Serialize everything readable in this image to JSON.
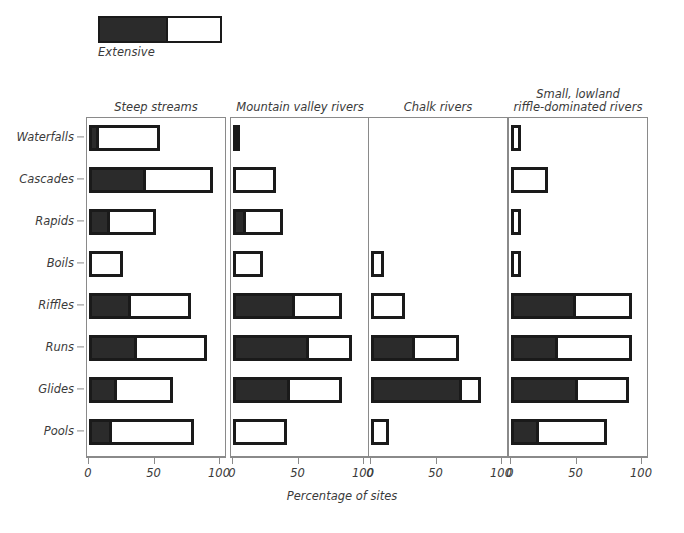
{
  "legend": {
    "label": "Extensive",
    "filled_color": "#2b2b2b",
    "open_color": "#ffffff",
    "border_color": "#1a1a1a"
  },
  "axis": {
    "x_title": "Percentage of sites",
    "tick_labels": [
      "0",
      "50",
      "100"
    ],
    "tick_values": [
      0,
      50,
      100
    ]
  },
  "chart_data": {
    "type": "bar",
    "orientation": "horizontal",
    "title": "",
    "subtitle": "",
    "xlabel": "Percentage of sites",
    "ylabel": "",
    "xlim": [
      0,
      100
    ],
    "grid": false,
    "legend_position": "top-left",
    "legend_entries": [
      "Extensive"
    ],
    "categories": [
      "Waterfalls",
      "Cascades",
      "Rapids",
      "Boils",
      "Riffles",
      "Runs",
      "Glides",
      "Pools"
    ],
    "panels": [
      {
        "title": "Steep streams",
        "series": [
          {
            "name": "Extensive",
            "values": [
              3,
              41,
              13,
              0,
              29,
              34,
              18,
              14
            ]
          },
          {
            "name": "Total",
            "values": [
              54,
              95,
              51,
              26,
              78,
              90,
              64,
              80
            ]
          }
        ]
      },
      {
        "title": "Mountain valley rivers",
        "series": [
          {
            "name": "Extensive",
            "values": [
              2,
              0,
              6,
              0,
              45,
              56,
              41,
              0
            ]
          },
          {
            "name": "Total",
            "values": [
              4,
              33,
              38,
              23,
              83,
              91,
              83,
              41
            ]
          }
        ]
      },
      {
        "title": "Chalk rivers",
        "series": [
          {
            "name": "Extensive",
            "values": [
              0,
              0,
              0,
              0,
              0,
              31,
              69,
              0
            ]
          },
          {
            "name": "Total",
            "values": [
              0,
              0,
              0,
              10,
              26,
              67,
              84,
              14
            ]
          }
        ]
      },
      {
        "title": "Small, lowland riffle-dominated rivers",
        "title_lines": [
          "Small, lowland",
          "riffle-dominated rivers"
        ],
        "series": [
          {
            "name": "Extensive",
            "values": [
              0,
              0,
              0,
              0,
              47,
              33,
              49,
              18
            ]
          },
          {
            "name": "Total",
            "values": [
              8,
              28,
              8,
              8,
              92,
              92,
              90,
              73
            ]
          }
        ]
      }
    ]
  },
  "layout": {
    "panel_geometry": [
      {
        "left": 86,
        "width": 140,
        "zero": 2,
        "hundred": 133
      },
      {
        "left": 230,
        "width": 140,
        "zero": 2,
        "hundred": 133
      },
      {
        "left": 368,
        "width": 140,
        "zero": 2,
        "hundred": 133
      },
      {
        "left": 508,
        "width": 140,
        "zero": 2,
        "hundred": 133
      }
    ],
    "row_centers": [
      20,
      62,
      104,
      146,
      188,
      230,
      272,
      314
    ],
    "panel_top": 117,
    "panel_height": 340
  }
}
